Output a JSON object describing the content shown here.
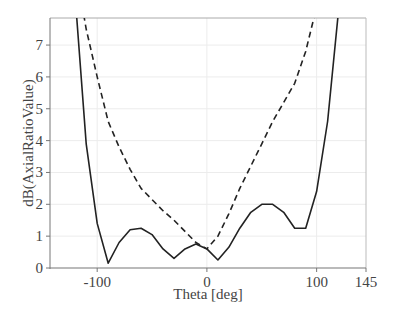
{
  "chart_data": {
    "type": "line",
    "title": "",
    "xlabel": "Theta [deg]",
    "ylabel": "dB(AxialRatioValue)",
    "xlim": [
      -143,
      145
    ],
    "ylim": [
      0,
      7.85
    ],
    "x_ticks": [
      -100,
      0,
      100,
      145
    ],
    "x_tick_labels": [
      "-100",
      "0",
      "100",
      "145"
    ],
    "y_ticks": [
      0,
      1,
      2,
      3,
      4,
      5,
      6,
      7
    ],
    "y_tick_labels": [
      "0",
      "1",
      "2",
      "3",
      "4",
      "5",
      "6",
      "7"
    ],
    "grid": true,
    "legend": null,
    "x": [
      -120,
      -110,
      -100,
      -90,
      -80,
      -70,
      -60,
      -50,
      -40,
      -30,
      -20,
      -10,
      0,
      10,
      20,
      30,
      40,
      50,
      60,
      70,
      80,
      90,
      100,
      110,
      120
    ],
    "series": [
      {
        "name": "solid",
        "style": "solid",
        "color": "#222222",
        "values": [
          8.5,
          3.9,
          1.4,
          0.15,
          0.8,
          1.2,
          1.25,
          1.05,
          0.6,
          0.3,
          0.6,
          0.75,
          0.6,
          0.25,
          0.65,
          1.25,
          1.75,
          2.0,
          2.0,
          1.75,
          1.25,
          1.25,
          2.4,
          4.6,
          8.1
        ]
      },
      {
        "name": "dashed",
        "style": "dashed",
        "color": "#222222",
        "values": [
          9.5,
          7.5,
          6.0,
          4.6,
          3.8,
          3.1,
          2.5,
          2.15,
          1.8,
          1.5,
          1.15,
          0.8,
          0.6,
          1.0,
          1.7,
          2.5,
          3.2,
          3.9,
          4.6,
          5.2,
          5.8,
          6.8,
          8.2,
          null,
          null
        ]
      }
    ]
  },
  "layout": {
    "plot_left": 50,
    "plot_right": 366,
    "plot_top": 18,
    "plot_bottom": 268
  }
}
